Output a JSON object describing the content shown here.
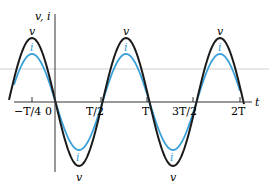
{
  "figure": {
    "y_axis_label": "v, i",
    "x_axis_label": "t",
    "tick_labels": [
      "−T/4",
      "0",
      "T/2",
      "T",
      "3T/2",
      "2T"
    ],
    "curve_labels": {
      "voltage": "v",
      "current": "i"
    },
    "colors": {
      "voltage": "#1a1a1a",
      "current": "#3aa0d8",
      "axis": "#333333",
      "reference_line": "#cfcfcf"
    }
  },
  "chart_data": {
    "type": "line",
    "title": "",
    "xlabel": "t",
    "ylabel": "v, i",
    "x_ticks": [
      "−T/4",
      "0",
      "T/2",
      "T",
      "3T/2",
      "2T"
    ],
    "series": [
      {
        "name": "v",
        "description": "sinusoidal voltage, larger amplitude",
        "amplitude": 1.0,
        "peaks_at": [
          "−T/4",
          "3T/4",
          "7T/4"
        ],
        "troughs_at": [
          "T/4",
          "5T/4"
        ]
      },
      {
        "name": "i",
        "description": "sinusoidal current, in phase with v, smaller amplitude",
        "amplitude": 0.75,
        "peaks_at": [
          "−T/4",
          "3T/4",
          "7T/4"
        ],
        "troughs_at": [
          "T/4",
          "5T/4"
        ]
      }
    ],
    "grid": false,
    "legend": "inline labels at peaks/troughs"
  }
}
